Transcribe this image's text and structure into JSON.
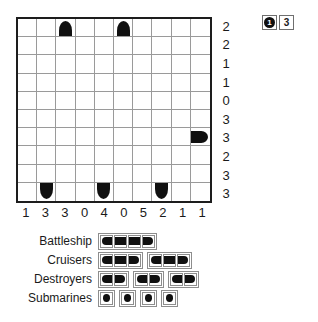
{
  "puzzle": {
    "name": "battleships-puzzle",
    "grid": {
      "rows": 10,
      "cols": 10,
      "row_clues": [
        2,
        2,
        1,
        1,
        0,
        3,
        3,
        2,
        3,
        3
      ],
      "col_clues": [
        1,
        3,
        3,
        0,
        4,
        0,
        5,
        2,
        1,
        1
      ],
      "given_pieces": [
        {
          "row": 0,
          "col": 2,
          "shape": "top"
        },
        {
          "row": 0,
          "col": 5,
          "shape": "top"
        },
        {
          "row": 6,
          "col": 9,
          "shape": "right"
        },
        {
          "row": 9,
          "col": 1,
          "shape": "bottom"
        },
        {
          "row": 9,
          "col": 4,
          "shape": "bottom"
        },
        {
          "row": 9,
          "col": 7,
          "shape": "bottom"
        }
      ]
    },
    "badges": [
      {
        "value": "1",
        "style": "disc"
      },
      {
        "value": "3",
        "style": "box"
      }
    ],
    "fleet": [
      {
        "label": "Battleship",
        "ships": [
          {
            "cells": [
              "left",
              "mid",
              "mid",
              "right"
            ]
          }
        ]
      },
      {
        "label": "Cruisers",
        "ships": [
          {
            "cells": [
              "left",
              "mid",
              "right"
            ]
          },
          {
            "cells": [
              "left",
              "mid",
              "right"
            ]
          }
        ]
      },
      {
        "label": "Destroyers",
        "ships": [
          {
            "cells": [
              "left",
              "right"
            ]
          },
          {
            "cells": [
              "left",
              "right"
            ]
          },
          {
            "cells": [
              "left",
              "right"
            ]
          }
        ]
      },
      {
        "label": "Submarines",
        "ships": [
          {
            "cells": [
              "sub"
            ]
          },
          {
            "cells": [
              "sub"
            ]
          },
          {
            "cells": [
              "sub"
            ]
          },
          {
            "cells": [
              "sub"
            ]
          }
        ]
      }
    ]
  },
  "colors": {
    "ship": "#101010",
    "grid_line": "#9a9a9a",
    "grid_border": "#1d1d1d",
    "background": "#ffffff"
  }
}
